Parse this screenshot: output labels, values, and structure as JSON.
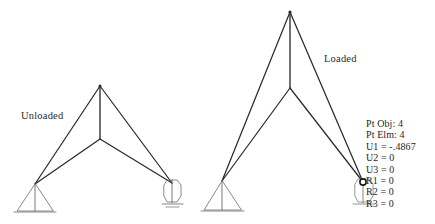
{
  "figure": {
    "background_color": "#ffffff",
    "line_color": "#2b2b2b",
    "width": 435,
    "height": 224,
    "labels": {
      "unloaded": "Unloaded",
      "loaded": "Loaded"
    },
    "structures": [
      {
        "name": "unloaded-truss",
        "state": "unloaded",
        "nodes": {
          "apex": [
            100,
            86
          ],
          "mid_joint": [
            100,
            139
          ],
          "left_support": [
            35,
            184
          ],
          "right_support": [
            172,
            183
          ]
        },
        "members": [
          [
            "apex",
            "left_support"
          ],
          [
            "apex",
            "mid_joint"
          ],
          [
            "apex",
            "right_support"
          ],
          [
            "mid_joint",
            "left_support"
          ],
          [
            "mid_joint",
            "right_support"
          ]
        ],
        "supports": [
          {
            "type": "pin",
            "at": [
              35,
              184
            ]
          },
          {
            "type": "roller",
            "at": [
              172,
              183
            ]
          }
        ]
      },
      {
        "name": "loaded-truss",
        "state": "loaded",
        "nodes": {
          "apex": [
            290,
            12
          ],
          "mid_joint": [
            290,
            88
          ],
          "left_support": [
            222,
            181
          ],
          "right_support": [
            363,
            182
          ]
        },
        "members": [
          [
            "apex",
            "left_support"
          ],
          [
            "apex",
            "mid_joint"
          ],
          [
            "apex",
            "right_support"
          ],
          [
            "mid_joint",
            "left_support"
          ],
          [
            "mid_joint",
            "right_support"
          ]
        ],
        "supports": [
          {
            "type": "pin",
            "at": [
              222,
              181
            ]
          },
          {
            "type": "roller",
            "at": [
              363,
              182
            ]
          }
        ],
        "selected_node_marker": {
          "at": [
            363,
            182
          ],
          "shape": "circle"
        }
      }
    ]
  },
  "readout": {
    "lines": [
      "Pt Obj: 4",
      "Pt Elm: 4",
      "U1 = -.4867",
      "U2 = 0",
      "U3 = 0",
      "R1 = 0",
      "R2 = 0",
      "R3 = 0"
    ],
    "point_object": "Pt Obj: 4",
    "point_element": "Pt Elm: 4",
    "u1": "U1 = -.4867",
    "u2": "U2 = 0",
    "u3": "U3 = 0",
    "r1": "R1 = 0",
    "r2": "R2 = 0",
    "r3": "R3 = 0"
  }
}
